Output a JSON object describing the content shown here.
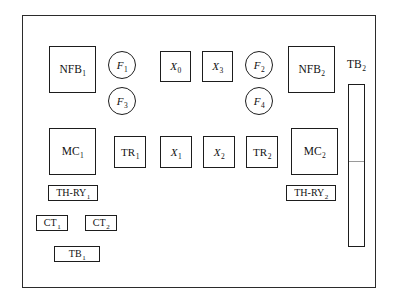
{
  "diagram": {
    "enclosure": {
      "name": "panel-enclosure"
    },
    "components": [
      {
        "id": "nfb1",
        "label": "NFB",
        "sub": "1",
        "shape": "rect",
        "x": 49,
        "y": 46,
        "w": 47,
        "h": 47,
        "italic": false,
        "size": "lg"
      },
      {
        "id": "f1",
        "label": "F",
        "sub": "1",
        "shape": "circle",
        "x": 108,
        "y": 51,
        "w": 28,
        "h": 28,
        "italic": true,
        "size": "md"
      },
      {
        "id": "f3",
        "label": "F",
        "sub": "3",
        "shape": "circle",
        "x": 108,
        "y": 87,
        "w": 28,
        "h": 28,
        "italic": true,
        "size": "md"
      },
      {
        "id": "x0",
        "label": "X",
        "sub": "0",
        "shape": "rect",
        "x": 160,
        "y": 51,
        "w": 31,
        "h": 31,
        "italic": true,
        "size": "md"
      },
      {
        "id": "x3",
        "label": "X",
        "sub": "3",
        "shape": "rect",
        "x": 202,
        "y": 51,
        "w": 31,
        "h": 31,
        "italic": true,
        "size": "md"
      },
      {
        "id": "f2",
        "label": "F",
        "sub": "2",
        "shape": "circle",
        "x": 245,
        "y": 51,
        "w": 28,
        "h": 28,
        "italic": true,
        "size": "md"
      },
      {
        "id": "f4",
        "label": "F",
        "sub": "4",
        "shape": "circle",
        "x": 245,
        "y": 87,
        "w": 28,
        "h": 28,
        "italic": true,
        "size": "md"
      },
      {
        "id": "nfb2",
        "label": "NFB",
        "sub": "2",
        "shape": "rect",
        "x": 288,
        "y": 46,
        "w": 47,
        "h": 47,
        "italic": false,
        "size": "lg"
      },
      {
        "id": "mc1",
        "label": "MC",
        "sub": "1",
        "shape": "rect",
        "x": 49,
        "y": 128,
        "w": 47,
        "h": 47,
        "italic": false,
        "size": "lg"
      },
      {
        "id": "tr1",
        "label": "TR",
        "sub": "1",
        "shape": "rect",
        "x": 114,
        "y": 136,
        "w": 32,
        "h": 32,
        "italic": false,
        "size": "md"
      },
      {
        "id": "x1",
        "label": "X",
        "sub": "1",
        "shape": "rect",
        "x": 160,
        "y": 136,
        "w": 32,
        "h": 32,
        "italic": true,
        "size": "md"
      },
      {
        "id": "x2",
        "label": "X",
        "sub": "2",
        "shape": "rect",
        "x": 203,
        "y": 136,
        "w": 32,
        "h": 32,
        "italic": true,
        "size": "md"
      },
      {
        "id": "tr2",
        "label": "TR",
        "sub": "2",
        "shape": "rect",
        "x": 246,
        "y": 136,
        "w": 32,
        "h": 32,
        "italic": false,
        "size": "md"
      },
      {
        "id": "mc2",
        "label": "MC",
        "sub": "2",
        "shape": "rect",
        "x": 291,
        "y": 128,
        "w": 47,
        "h": 47,
        "italic": false,
        "size": "lg"
      },
      {
        "id": "thry1",
        "label": "TH-RY",
        "sub": "1",
        "shape": "rect",
        "x": 48,
        "y": 185,
        "w": 50,
        "h": 16,
        "italic": false,
        "size": "sm",
        "thin": true
      },
      {
        "id": "thry2",
        "label": "TH-RY",
        "sub": "2",
        "shape": "rect",
        "x": 286,
        "y": 185,
        "w": 50,
        "h": 16,
        "italic": false,
        "size": "sm",
        "thin": true
      },
      {
        "id": "ct1",
        "label": "CT",
        "sub": "1",
        "shape": "rect",
        "x": 36,
        "y": 215,
        "w": 32,
        "h": 16,
        "italic": false,
        "size": "sm",
        "thin": true
      },
      {
        "id": "ct2",
        "label": "CT",
        "sub": "2",
        "shape": "rect",
        "x": 85,
        "y": 215,
        "w": 32,
        "h": 16,
        "italic": false,
        "size": "sm",
        "thin": true
      },
      {
        "id": "tb1",
        "label": "TB",
        "sub": "1",
        "shape": "rect",
        "x": 54,
        "y": 246,
        "w": 46,
        "h": 16,
        "italic": false,
        "size": "sm",
        "thin": true
      }
    ],
    "terminal_block": {
      "name": "tb2-terminal-strip",
      "label": "TB",
      "sub": "2",
      "label_x": 347,
      "label_y": 59,
      "bar_x": 348,
      "bar_y": 84,
      "bar_w": 17,
      "bar_h": 163,
      "divider_offset": 76
    },
    "colors": {
      "stroke": "#1d1d1d",
      "frame": "#2b2b2b",
      "background": "#ffffff",
      "text": "#121212",
      "divider": "#9a9a9a"
    },
    "frame": {
      "x": 22,
      "y": 15,
      "w": 354,
      "h": 273
    }
  }
}
